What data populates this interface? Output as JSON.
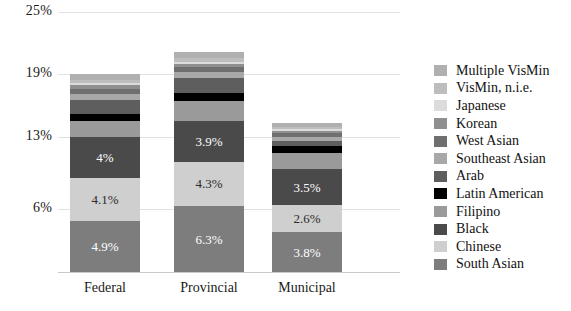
{
  "chart_data": {
    "type": "bar",
    "stacked": true,
    "title": "",
    "subtitle": "",
    "xlabel": "",
    "ylabel": "",
    "categories": [
      "Federal",
      "Provincial",
      "Municipal"
    ],
    "ytick_labels": [
      "25%",
      "19%",
      "13%",
      "6%"
    ],
    "ytick_values": [
      25,
      19,
      13,
      6
    ],
    "ylim": [
      0,
      26
    ],
    "grid": true,
    "legend_position": "right",
    "series": [
      {
        "name": "South Asian",
        "color": "#7d7d7d",
        "values": [
          4.9,
          6.3,
          3.8
        ],
        "data_labels": [
          "4.9%",
          "6.3%",
          "3.8%"
        ]
      },
      {
        "name": "Chinese",
        "color": "#cfcfcf",
        "values": [
          4.1,
          4.3,
          2.6
        ],
        "data_labels": [
          "4.1%",
          "4.3%",
          "2.6%"
        ]
      },
      {
        "name": "Black",
        "color": "#4a4a4a",
        "values": [
          4.0,
          3.9,
          3.5
        ],
        "data_labels": [
          "4%",
          "3.9%",
          "3.5%"
        ]
      },
      {
        "name": "Filipino",
        "color": "#9a9a9a",
        "values": [
          1.5,
          1.9,
          1.5
        ],
        "data_labels": [
          "",
          "",
          ""
        ]
      },
      {
        "name": "Latin American",
        "color": "#000000",
        "values": [
          0.7,
          0.8,
          0.7
        ],
        "data_labels": [
          "",
          "",
          ""
        ]
      },
      {
        "name": "Arab",
        "color": "#5e5e5e",
        "values": [
          1.3,
          1.4,
          0.5
        ],
        "data_labels": [
          "",
          "",
          ""
        ]
      },
      {
        "name": "Southeast Asian",
        "color": "#a8a8a8",
        "values": [
          0.6,
          0.6,
          0.4
        ],
        "data_labels": [
          "",
          "",
          ""
        ]
      },
      {
        "name": "West Asian",
        "color": "#6f6f6f",
        "values": [
          0.5,
          0.5,
          0.3
        ],
        "data_labels": [
          "",
          "",
          ""
        ]
      },
      {
        "name": "Korean",
        "color": "#8f8f8f",
        "values": [
          0.3,
          0.3,
          0.2
        ],
        "data_labels": [
          "",
          "",
          ""
        ]
      },
      {
        "name": "Japanese",
        "color": "#dcdcdc",
        "values": [
          0.2,
          0.2,
          0.2
        ],
        "data_labels": [
          "",
          "",
          ""
        ]
      },
      {
        "name": "VisMin, n.i.e.",
        "color": "#bdbdbd",
        "values": [
          0.3,
          0.3,
          0.2
        ],
        "data_labels": [
          "",
          "",
          ""
        ]
      },
      {
        "name": "Multiple VisMin",
        "color": "#b0b0b0",
        "values": [
          0.6,
          0.6,
          0.4
        ],
        "data_labels": [
          "",
          "",
          ""
        ]
      }
    ],
    "totals": [
      19.0,
      20.9,
      14.3
    ]
  },
  "legend": {
    "items": [
      {
        "label": "Multiple VisMin",
        "color": "#b0b0b0"
      },
      {
        "label": "VisMin, n.i.e.",
        "color": "#bdbdbd"
      },
      {
        "label": "Japanese",
        "color": "#dcdcdc"
      },
      {
        "label": "Korean",
        "color": "#8f8f8f"
      },
      {
        "label": "West Asian",
        "color": "#6f6f6f"
      },
      {
        "label": "Southeast Asian",
        "color": "#a8a8a8"
      },
      {
        "label": "Arab",
        "color": "#5e5e5e"
      },
      {
        "label": "Latin American",
        "color": "#000000"
      },
      {
        "label": "Filipino",
        "color": "#9a9a9a"
      },
      {
        "label": "Black",
        "color": "#4a4a4a"
      },
      {
        "label": "Chinese",
        "color": "#cfcfcf"
      },
      {
        "label": "South Asian",
        "color": "#7d7d7d"
      }
    ]
  },
  "axis": {
    "gridline_color": "#e2e2e2",
    "baseline_color": "#c9c9c9"
  }
}
